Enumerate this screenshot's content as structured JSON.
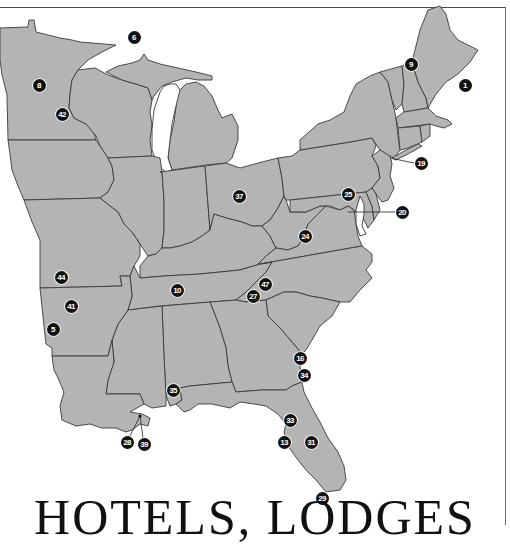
{
  "map": {
    "region": "Eastern United States",
    "land_color": "#b4b4b4",
    "border_color": "#3a3a3a",
    "water_color": "#ffffff",
    "marker_color": "#111111",
    "marker_text_color": "#ffffff"
  },
  "title": {
    "text": "HOTELS, LODGES"
  },
  "markers": [
    {
      "id": "1",
      "label": "1",
      "x": 465,
      "y": 85
    },
    {
      "id": "5",
      "label": "5",
      "x": 53,
      "y": 329
    },
    {
      "id": "6",
      "label": "6",
      "x": 134,
      "y": 37
    },
    {
      "id": "8",
      "label": "8",
      "x": 39,
      "y": 85
    },
    {
      "id": "9",
      "label": "9",
      "x": 411,
      "y": 64
    },
    {
      "id": "10",
      "label": "10",
      "x": 177,
      "y": 290
    },
    {
      "id": "13",
      "label": "13",
      "x": 284,
      "y": 442
    },
    {
      "id": "16",
      "label": "16",
      "x": 300,
      "y": 358
    },
    {
      "id": "19",
      "label": "19",
      "x": 421,
      "y": 163
    },
    {
      "id": "20",
      "label": "20",
      "x": 402,
      "y": 212
    },
    {
      "id": "24",
      "label": "24",
      "x": 305,
      "y": 236
    },
    {
      "id": "25",
      "label": "25",
      "x": 348,
      "y": 194
    },
    {
      "id": "27",
      "label": "27",
      "x": 253,
      "y": 296
    },
    {
      "id": "28",
      "label": "28",
      "x": 127,
      "y": 442
    },
    {
      "id": "29",
      "label": "29",
      "x": 322,
      "y": 498
    },
    {
      "id": "31",
      "label": "31",
      "x": 311,
      "y": 442
    },
    {
      "id": "33",
      "label": "33",
      "x": 290,
      "y": 420
    },
    {
      "id": "34",
      "label": "34",
      "x": 304,
      "y": 375
    },
    {
      "id": "35",
      "label": "35",
      "x": 173,
      "y": 390
    },
    {
      "id": "37",
      "label": "37",
      "x": 239,
      "y": 196
    },
    {
      "id": "39",
      "label": "39",
      "x": 144,
      "y": 444
    },
    {
      "id": "41",
      "label": "41",
      "x": 71,
      "y": 306
    },
    {
      "id": "42",
      "label": "42",
      "x": 62,
      "y": 114
    },
    {
      "id": "44",
      "label": "44",
      "x": 61,
      "y": 277
    },
    {
      "id": "47",
      "label": "47",
      "x": 265,
      "y": 284
    }
  ],
  "leaders": [
    {
      "from_marker": "19",
      "x1": 414,
      "y1": 163,
      "x2": 390,
      "y2": 158
    },
    {
      "from_marker": "20",
      "x1": 395,
      "y1": 212,
      "x2": 348,
      "y2": 212
    },
    {
      "from_marker": "28",
      "x1": 130,
      "y1": 436,
      "x2": 140,
      "y2": 416
    },
    {
      "from_marker": "39",
      "x1": 143,
      "y1": 438,
      "x2": 140,
      "y2": 416
    }
  ]
}
